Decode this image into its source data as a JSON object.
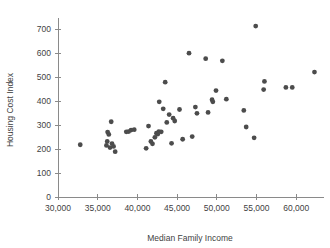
{
  "chart_data": {
    "type": "scatter",
    "title": "",
    "xlabel": "Median Family Income",
    "ylabel": "Housing Cost Index",
    "xlim": [
      30000,
      63500
    ],
    "ylim": [
      0,
      730
    ],
    "grid": false,
    "legend": null,
    "xticks": [
      30000,
      35000,
      40000,
      45000,
      50000,
      55000,
      60000
    ],
    "xtick_labels": [
      "30,000",
      "35,000",
      "40,000",
      "45,000",
      "50,000",
      "55,000",
      "60,000"
    ],
    "yticks": [
      0,
      100,
      200,
      300,
      400,
      500,
      600,
      700
    ],
    "ytick_labels": [
      "0",
      "100",
      "200",
      "300",
      "400",
      "500",
      "600",
      "700"
    ],
    "marker": {
      "shape": "circle",
      "color": "#4c4c4c",
      "radius_px": 2.4
    },
    "points": [
      {
        "x": 32800,
        "y": 218
      },
      {
        "x": 36100,
        "y": 215
      },
      {
        "x": 36200,
        "y": 232
      },
      {
        "x": 36250,
        "y": 271
      },
      {
        "x": 36400,
        "y": 261
      },
      {
        "x": 36550,
        "y": 206
      },
      {
        "x": 36700,
        "y": 314
      },
      {
        "x": 36800,
        "y": 223
      },
      {
        "x": 37000,
        "y": 211
      },
      {
        "x": 37200,
        "y": 189
      },
      {
        "x": 38600,
        "y": 272
      },
      {
        "x": 38900,
        "y": 273
      },
      {
        "x": 39200,
        "y": 279
      },
      {
        "x": 39600,
        "y": 281
      },
      {
        "x": 41100,
        "y": 203
      },
      {
        "x": 41400,
        "y": 296
      },
      {
        "x": 41700,
        "y": 232
      },
      {
        "x": 41900,
        "y": 222
      },
      {
        "x": 42200,
        "y": 249
      },
      {
        "x": 42400,
        "y": 266
      },
      {
        "x": 42550,
        "y": 262
      },
      {
        "x": 42700,
        "y": 273
      },
      {
        "x": 42750,
        "y": 397
      },
      {
        "x": 43000,
        "y": 272
      },
      {
        "x": 43250,
        "y": 368
      },
      {
        "x": 43500,
        "y": 479
      },
      {
        "x": 43700,
        "y": 311
      },
      {
        "x": 44000,
        "y": 344
      },
      {
        "x": 44300,
        "y": 224
      },
      {
        "x": 44500,
        "y": 329
      },
      {
        "x": 44700,
        "y": 317
      },
      {
        "x": 45300,
        "y": 365
      },
      {
        "x": 45700,
        "y": 241
      },
      {
        "x": 46500,
        "y": 600
      },
      {
        "x": 46900,
        "y": 252
      },
      {
        "x": 47300,
        "y": 375
      },
      {
        "x": 47500,
        "y": 349
      },
      {
        "x": 48600,
        "y": 577
      },
      {
        "x": 48900,
        "y": 353
      },
      {
        "x": 49400,
        "y": 406
      },
      {
        "x": 49500,
        "y": 397
      },
      {
        "x": 49900,
        "y": 444
      },
      {
        "x": 50700,
        "y": 568
      },
      {
        "x": 51200,
        "y": 408
      },
      {
        "x": 53400,
        "y": 361
      },
      {
        "x": 53700,
        "y": 292
      },
      {
        "x": 54700,
        "y": 247
      },
      {
        "x": 54900,
        "y": 713
      },
      {
        "x": 55900,
        "y": 448
      },
      {
        "x": 56000,
        "y": 482
      },
      {
        "x": 58700,
        "y": 457
      },
      {
        "x": 59500,
        "y": 457
      },
      {
        "x": 62300,
        "y": 521
      }
    ]
  },
  "geometry": {
    "plot_left_px": 58,
    "plot_right_px": 324,
    "plot_top_px": 22,
    "plot_bottom_px": 197
  }
}
